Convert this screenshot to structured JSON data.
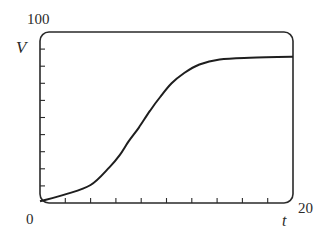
{
  "chart_data": {
    "type": "line",
    "title": "",
    "xlabel": "t",
    "ylabel": "V",
    "xlim": [
      0,
      20
    ],
    "ylim": [
      0,
      100
    ],
    "x_tick_labels": {
      "min": "0",
      "max": "20"
    },
    "y_tick_labels": {
      "max": "100"
    },
    "x_tick_step": 2,
    "y_tick_step": 10,
    "grid": false,
    "legend": null,
    "series": [
      {
        "name": "V(t)",
        "x": [
          0,
          2,
          4,
          5.5,
          6.3,
          7,
          7.8,
          8.7,
          9.5,
          10.4,
          11.4,
          12.6,
          14.2,
          16.6,
          20
        ],
        "values": [
          1,
          5,
          10.5,
          21,
          28,
          36,
          44,
          54,
          62,
          70,
          76,
          81,
          84,
          85,
          85.5
        ]
      }
    ]
  },
  "labels": {
    "y_max": "100",
    "y_axis": "V",
    "x_min": "0",
    "x_axis": "t",
    "x_max": "20"
  },
  "colors": {
    "frame": "#2a2a2a",
    "curve": "#1e1e1e"
  }
}
